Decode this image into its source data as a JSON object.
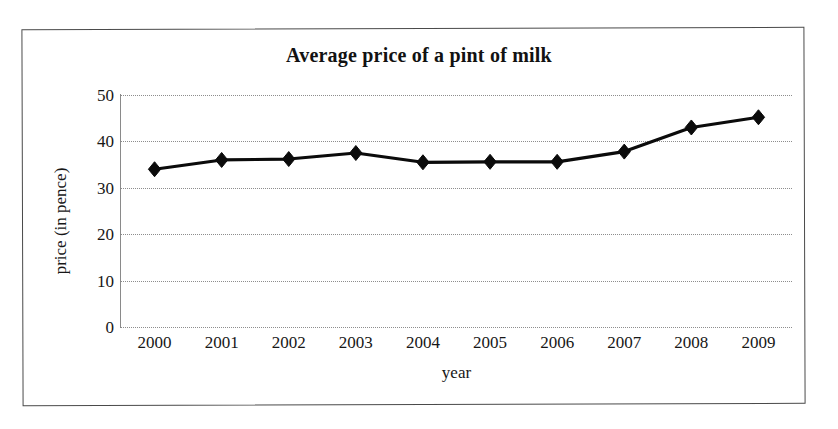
{
  "document": {
    "frame_border_color": "#4a4a4a",
    "background": "#ffffff"
  },
  "chart_data": {
    "type": "line",
    "title": "Average price of a pint of milk",
    "xlabel": "year",
    "ylabel": "price (in pence)",
    "categories": [
      "2000",
      "2001",
      "2002",
      "2003",
      "2004",
      "2005",
      "2006",
      "2007",
      "2008",
      "2009"
    ],
    "values": [
      34,
      36,
      36.2,
      37.5,
      35.5,
      35.6,
      35.6,
      37.8,
      43,
      45.2
    ],
    "ylim": [
      0,
      50
    ],
    "y_ticks": [
      "0",
      "10",
      "20",
      "30",
      "40",
      "50"
    ],
    "y_tick_values": [
      0,
      10,
      20,
      30,
      40,
      50
    ],
    "grid": "horizontal-dotted",
    "legend": "none",
    "series_color": "#0b0b0b",
    "grid_color": "#8d8d8d",
    "marker": "diamond"
  }
}
